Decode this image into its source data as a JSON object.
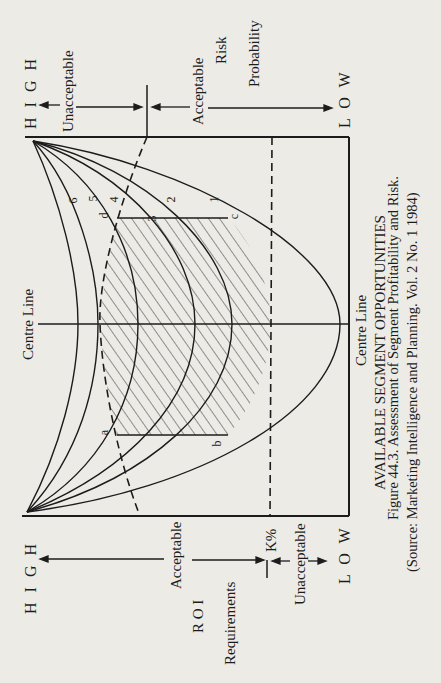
{
  "diagram": {
    "title": "AVAILABLE SEGMENT OPPORTUNITIES",
    "caption_line1": "Figure 44.3. Assessment of Segment Profitability and Risk.",
    "caption_line2": "(Source: Marketing Intelligence and Planning. Vol. 2 No. 1 1984)",
    "centre_line_top": "Centre Line",
    "centre_line_bottom": "Centre Line",
    "risk_axis": {
      "title1": "Risk",
      "title2": "Probability",
      "high": "H I G H",
      "low": "L O W",
      "unacceptable": "Unacceptable",
      "acceptable": "Acceptable"
    },
    "roi_axis": {
      "title1": "R O I",
      "title2": "Requirements",
      "high": "H I G H",
      "low": "L O W",
      "acceptable": "Acceptable",
      "unacceptable": "Unacceptable",
      "threshold": "K%"
    },
    "curve_labels": [
      "1",
      "2",
      "3",
      "4",
      "5",
      "6"
    ],
    "point_labels": {
      "a": "a",
      "b": "b",
      "c": "c",
      "d": "d"
    },
    "colors": {
      "ink": "#1c1c1c",
      "paper": "#ecebe6"
    }
  }
}
